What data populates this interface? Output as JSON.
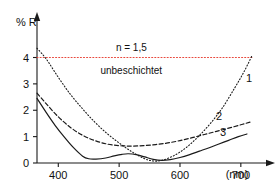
{
  "chart_data": {
    "type": "line",
    "title": "",
    "xlabel": "(nm)",
    "ylabel": "% R",
    "xlim": [
      365,
      720
    ],
    "ylim": [
      0,
      4.55
    ],
    "xticks": [
      400,
      500,
      600,
      700
    ],
    "xtick_labels": [
      "400",
      "500",
      "600",
      "700"
    ],
    "yticks": [
      0,
      1,
      2,
      3,
      4
    ],
    "ytick_labels": [
      "0",
      "1",
      "2",
      "3",
      "4"
    ],
    "grid": false,
    "legend_position": "inline-right",
    "annotations": [
      {
        "id": "refractive-index",
        "text": "n = 1,5",
        "x": 520,
        "y": 4.35
      },
      {
        "id": "uncoated",
        "text": "unbeschichtet",
        "x": 520,
        "y": 3.5
      }
    ],
    "series": [
      {
        "name": "unbeschichtet",
        "label": "",
        "style": "dotted",
        "color": "#e8483c",
        "x": [
          365,
          720
        ],
        "values": [
          4.0,
          4.0
        ]
      },
      {
        "name": "1",
        "label": "1",
        "style": "dotted",
        "color": "#1a1a1a",
        "x": [
          365,
          380,
          400,
          420,
          440,
          460,
          480,
          500,
          520,
          540,
          555,
          570,
          590,
          610,
          630,
          650,
          670,
          690,
          705,
          718
        ],
        "values": [
          4.35,
          3.95,
          3.25,
          2.6,
          2.05,
          1.55,
          1.12,
          0.76,
          0.44,
          0.18,
          0.08,
          0.1,
          0.28,
          0.58,
          1.0,
          1.5,
          2.1,
          2.85,
          3.45,
          4.05
        ]
      },
      {
        "name": "2",
        "label": "2",
        "style": "dashed",
        "color": "#1a1a1a",
        "x": [
          365,
          380,
          400,
          420,
          440,
          460,
          480,
          500,
          520,
          540,
          560,
          580,
          600,
          620,
          640,
          660,
          680,
          700,
          715
        ],
        "values": [
          2.65,
          2.25,
          1.75,
          1.35,
          1.05,
          0.85,
          0.72,
          0.66,
          0.64,
          0.66,
          0.7,
          0.76,
          0.85,
          0.96,
          1.08,
          1.2,
          1.32,
          1.45,
          1.55
        ]
      },
      {
        "name": "3",
        "label": "3",
        "style": "solid",
        "color": "#1a1a1a",
        "x": [
          365,
          380,
          395,
          410,
          425,
          440,
          450,
          462,
          478,
          492,
          505,
          515,
          528,
          542,
          556,
          570,
          584,
          600,
          616,
          632,
          648,
          664,
          680,
          696,
          710
        ],
        "values": [
          2.45,
          1.92,
          1.42,
          0.98,
          0.58,
          0.26,
          0.16,
          0.15,
          0.19,
          0.27,
          0.33,
          0.35,
          0.32,
          0.23,
          0.14,
          0.1,
          0.13,
          0.21,
          0.32,
          0.45,
          0.58,
          0.72,
          0.86,
          1.0,
          1.1
        ]
      }
    ]
  },
  "axes": {
    "y_axis_title": "% R",
    "x_axis_unit": "(nm)"
  },
  "colors": {
    "uncoated_line": "#e8483c",
    "curve": "#1a1a1a",
    "axis": "#1a1a1a"
  }
}
